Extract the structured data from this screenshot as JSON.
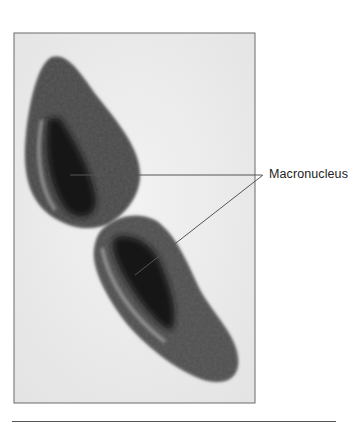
{
  "figure": {
    "type": "micrograph",
    "annotations": [
      {
        "label": "Macronucleus",
        "pointers": 2
      }
    ]
  },
  "colors": {
    "frame": "#6a6a6a",
    "background": "#ececec",
    "cell": "#3a3a3a",
    "nucleus": "#111111",
    "leader": "#555555"
  }
}
